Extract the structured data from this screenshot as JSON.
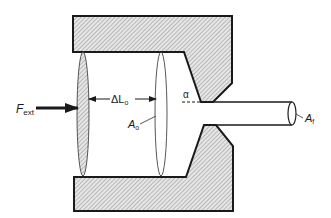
{
  "diagram": {
    "type": "extrusion-schematic",
    "colors": {
      "stroke": "#1a1a1a",
      "hatch_bg": "#e6e6e6",
      "hatch_line": "#8a8a8a",
      "background": "#ffffff"
    },
    "labels": {
      "force": {
        "main": "F",
        "sub": "ext"
      },
      "delta_length": {
        "main": "ΔL",
        "sub": "o"
      },
      "initial_area": {
        "main": "A",
        "sub": "o"
      },
      "final_area": {
        "main": "A",
        "sub": "f"
      },
      "die_angle": "α"
    }
  }
}
